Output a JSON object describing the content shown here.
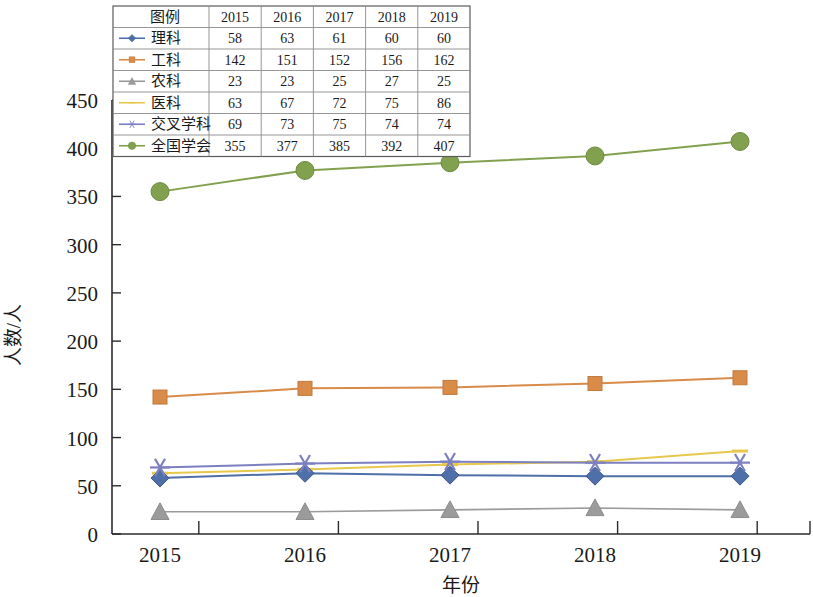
{
  "chart_data": {
    "type": "line",
    "title": "",
    "xlabel": "年份",
    "ylabel": "人数/人",
    "categories": [
      "2015",
      "2016",
      "2017",
      "2018",
      "2019"
    ],
    "xlim": [
      2015,
      2019
    ],
    "ylim": [
      0,
      450
    ],
    "ytick_step": 50,
    "yticks": [
      "0",
      "50",
      "100",
      "150",
      "200",
      "250",
      "300",
      "350",
      "400",
      "450"
    ],
    "grid": false,
    "legend_position": "top-left-table",
    "series": [
      {
        "name": "理科",
        "values": [
          58,
          63,
          61,
          60,
          60
        ],
        "color": "#4f6fa8",
        "marker": "diamond"
      },
      {
        "name": "工科",
        "values": [
          142,
          151,
          152,
          156,
          162
        ],
        "color": "#d98b4a",
        "marker": "square"
      },
      {
        "name": "农科",
        "values": [
          23,
          23,
          25,
          27,
          25
        ],
        "color": "#9b9b9b",
        "marker": "triangle"
      },
      {
        "name": "医科",
        "values": [
          63,
          67,
          72,
          75,
          86
        ],
        "color": "#e8c84c",
        "marker": "dash"
      },
      {
        "name": "交叉学科",
        "values": [
          69,
          73,
          75,
          74,
          74
        ],
        "color": "#7c7fc0",
        "marker": "asterisk"
      },
      {
        "name": "全国学会",
        "values": [
          355,
          377,
          385,
          392,
          407
        ],
        "color": "#82a14e",
        "marker": "circle"
      }
    ]
  },
  "legend_table": {
    "corner_header": "图例",
    "column_headers": [
      "2015",
      "2016",
      "2017",
      "2018",
      "2019"
    ],
    "rows": [
      {
        "name": "理科",
        "cells": [
          "58",
          "63",
          "61",
          "60",
          "60"
        ]
      },
      {
        "name": "工科",
        "cells": [
          "142",
          "151",
          "152",
          "156",
          "162"
        ]
      },
      {
        "name": "农科",
        "cells": [
          "23",
          "23",
          "25",
          "27",
          "25"
        ]
      },
      {
        "name": "医科",
        "cells": [
          "63",
          "67",
          "72",
          "75",
          "86"
        ]
      },
      {
        "name": "交叉学科",
        "cells": [
          "69",
          "73",
          "75",
          "74",
          "74"
        ]
      },
      {
        "name": "全国学会",
        "cells": [
          "355",
          "377",
          "385",
          "392",
          "407"
        ]
      }
    ]
  }
}
